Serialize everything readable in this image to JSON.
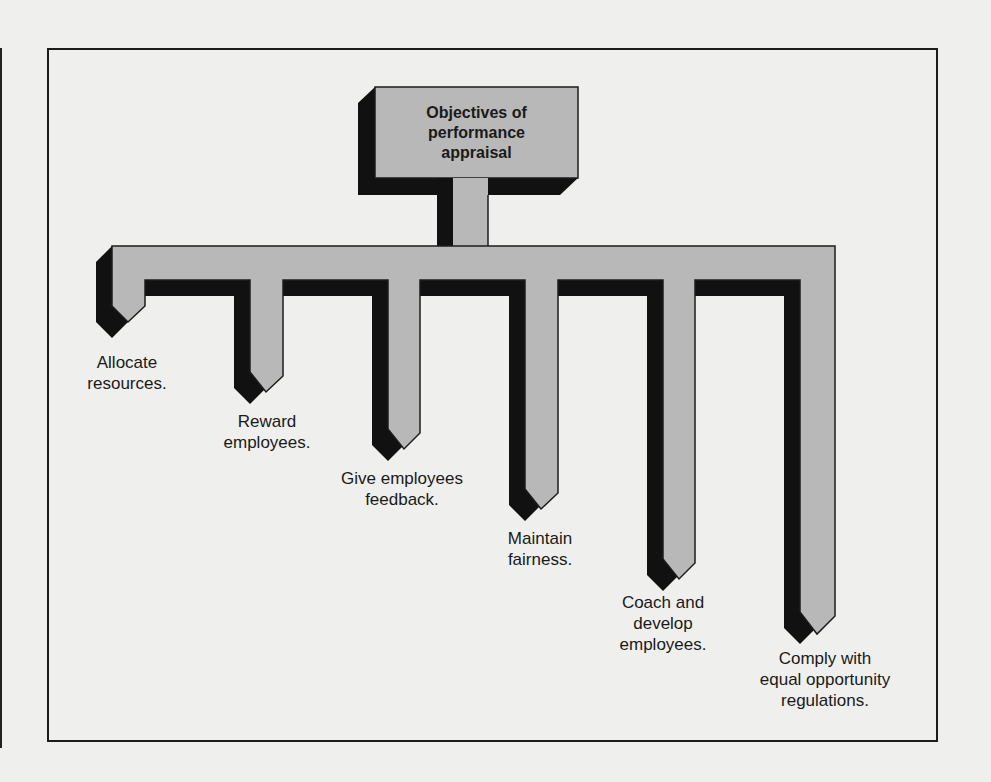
{
  "diagram": {
    "title": "Objectives of\nperformance\nappraisal",
    "branches": [
      {
        "label": "Allocate\nresources."
      },
      {
        "label": "Reward\nemployees."
      },
      {
        "label": "Give employees\nfeedback."
      },
      {
        "label": "Maintain\nfairness."
      },
      {
        "label": "Coach and\ndevelop\nemployees."
      },
      {
        "label": "Comply with\nequal opportunity\nregulations."
      }
    ],
    "colors": {
      "fill": "#b8b8b8",
      "shadow": "#111111",
      "outline": "#1c1c1c",
      "background": "#efefed"
    }
  }
}
